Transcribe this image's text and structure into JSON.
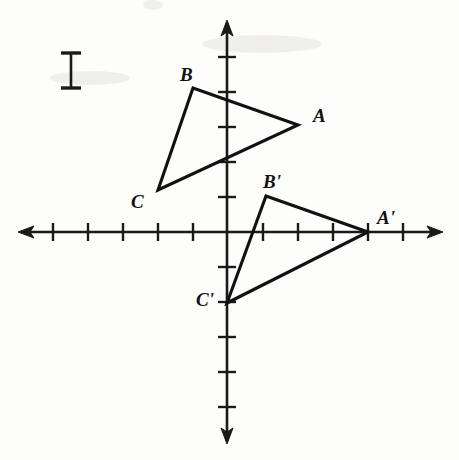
{
  "figure": {
    "background_color": "#fdfdfc",
    "ink_color": "#111111"
  },
  "axes": {
    "origin_px": {
      "x": 227,
      "y": 232
    },
    "unit_px": 35,
    "x_axis": {
      "name": "x-axis",
      "y_px": 232,
      "start_px": 18,
      "end_px": 443,
      "tick_positions_px": [
        53,
        88,
        123,
        158,
        193,
        263,
        298,
        333,
        368,
        403
      ],
      "tick_values": [
        -5,
        -4,
        -3,
        -2,
        -1,
        1,
        2,
        3,
        4,
        5
      ],
      "tick_half_length_px": 9,
      "arrows": "both"
    },
    "y_axis": {
      "name": "y-axis",
      "x_px": 227,
      "start_px": 20,
      "end_px": 444,
      "tick_positions_px": [
        57,
        92,
        127,
        162,
        197,
        267,
        302,
        337,
        372,
        407
      ],
      "tick_values": [
        5,
        4,
        3,
        2,
        1,
        -1,
        -2,
        -3,
        -4,
        -5
      ],
      "tick_half_length_px": 9,
      "arrows": "both"
    },
    "gridlines": false
  },
  "scale_marker": {
    "name": "unit-length-marker",
    "x_px": 71,
    "top_px": 53,
    "bottom_px": 88,
    "cap_half_width_px": 10,
    "meaning": "one unit"
  },
  "chart_data": {
    "type": "scatter",
    "xlabel": "",
    "ylabel": "",
    "xlim": [
      -6,
      6
    ],
    "ylim": [
      -6,
      6
    ],
    "grid": false,
    "legend": "none",
    "series": [
      {
        "name": "Triangle ABC",
        "closed": true,
        "points": [
          {
            "label": "A",
            "x": 2,
            "y": 3
          },
          {
            "label": "B",
            "x": -1,
            "y": 4.1
          },
          {
            "label": "C",
            "x": -2,
            "y": -1.2
          }
        ],
        "points_px": [
          {
            "label": "A",
            "x": 298,
            "y": 125
          },
          {
            "label": "B",
            "x": 193,
            "y": 88
          },
          {
            "label": "C",
            "x": 158,
            "y": 190
          }
        ]
      },
      {
        "name": "Triangle A'B'C'",
        "closed": true,
        "points": [
          {
            "label": "A'",
            "x": 4,
            "y": 0
          },
          {
            "label": "B'",
            "x": 1.1,
            "y": 1.05
          },
          {
            "label": "C'",
            "x": 0,
            "y": -2
          }
        ],
        "points_px": [
          {
            "label": "A'",
            "x": 368,
            "y": 232
          },
          {
            "label": "B'",
            "x": 266,
            "y": 196
          },
          {
            "label": "C'",
            "x": 227,
            "y": 303
          }
        ]
      }
    ]
  },
  "labels": [
    {
      "name": "vertex-label-a",
      "text": "A",
      "x_px": 313,
      "y_px": 122
    },
    {
      "name": "vertex-label-b",
      "text": "B",
      "x_px": 180,
      "y_px": 81
    },
    {
      "name": "vertex-label-c",
      "text": "C",
      "x_px": 131,
      "y_px": 208
    },
    {
      "name": "vertex-label-a-prime",
      "text": "A'",
      "x_px": 377,
      "y_px": 224
    },
    {
      "name": "vertex-label-b-prime",
      "text": "B'",
      "x_px": 263,
      "y_px": 188
    },
    {
      "name": "vertex-label-c-prime",
      "text": "C'",
      "x_px": 196,
      "y_px": 306
    }
  ]
}
